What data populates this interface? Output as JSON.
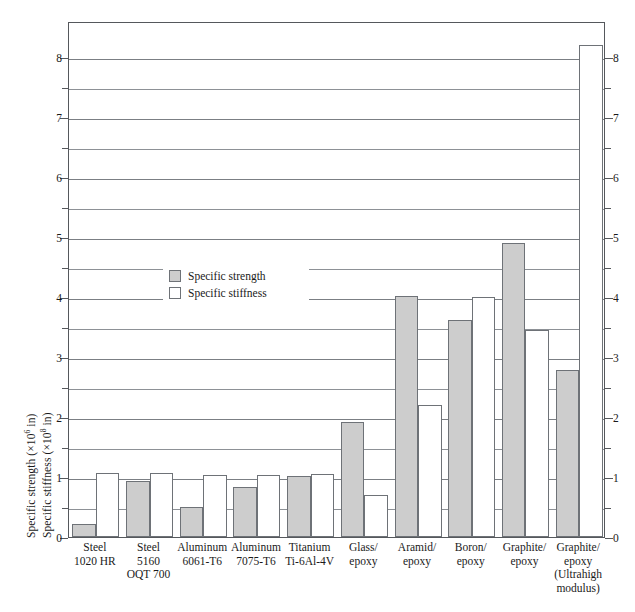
{
  "chart_data": {
    "type": "bar",
    "title": "",
    "xlabel": "",
    "ylabel_left_strength": "Specific strength (×10⁶ in)",
    "ylabel_left_stiffness": "Specific stiffness (×10⁸ in)",
    "ylabel_strength_prefix": "Specific strength (×10",
    "ylabel_strength_exp": "6",
    "ylabel_strength_suffix": " in)",
    "ylabel_stiffness_prefix": "Specific stiffness (×10",
    "ylabel_stiffness_exp": "8",
    "ylabel_stiffness_suffix": " in)",
    "ylim": [
      0,
      8.6
    ],
    "ytick_major": [
      0,
      1,
      2,
      3,
      4,
      5,
      6,
      7,
      8
    ],
    "ytick_minor": [
      0.5,
      1.5,
      2.5,
      3.5,
      4.5,
      5.5,
      6.5,
      7.5
    ],
    "ytick_labels_left": [
      "0",
      "1",
      "2",
      "3",
      "4",
      "5",
      "6",
      "7",
      "8"
    ],
    "ytick_labels_right": [
      "0",
      "1",
      "2",
      "3",
      "4",
      "5",
      "6",
      "7",
      "8"
    ],
    "grid": true,
    "legend_position": "inside-upper-left",
    "categories": [
      "Steel 1020 HR",
      "Steel 5160 OQT 700",
      "Aluminum 6061-T6",
      "Aluminum 7075-T6",
      "Titanium Ti-6Al-4V",
      "Glass/epoxy",
      "Aramid/epoxy",
      "Boron/epoxy",
      "Graphite/epoxy",
      "Graphite/epoxy (Ultrahigh modulus)"
    ],
    "category_lines": [
      [
        "Steel",
        "1020 HR"
      ],
      [
        "Steel",
        "5160",
        "OQT 700"
      ],
      [
        "Aluminum",
        "6061-T6"
      ],
      [
        "Aluminum",
        "7075-T6"
      ],
      [
        "Titanium",
        "Ti-6Al-4V"
      ],
      [
        "Glass/",
        "epoxy"
      ],
      [
        "Aramid/",
        "epoxy"
      ],
      [
        "Boron/",
        "epoxy"
      ],
      [
        "Graphite/",
        "epoxy"
      ],
      [
        "Graphite/",
        "epoxy",
        "(Ultrahigh",
        "modulus)"
      ]
    ],
    "series": [
      {
        "name": "Specific strength",
        "color": "#cdcdcd",
        "values": [
          0.22,
          0.93,
          0.5,
          0.83,
          1.02,
          1.92,
          4.02,
          3.62,
          4.9,
          2.78
        ]
      },
      {
        "name": "Specific stiffness",
        "color": "#ffffff",
        "values": [
          1.07,
          1.06,
          1.04,
          1.04,
          1.05,
          0.7,
          2.2,
          4.0,
          3.45,
          8.2
        ]
      }
    ]
  },
  "legend": {
    "items": [
      {
        "label": "Specific strength",
        "swatch": "strength"
      },
      {
        "label": "Specific stiffness",
        "swatch": "stiffness"
      }
    ]
  },
  "colors": {
    "bar_strength_fill": "#cdcdcd",
    "bar_stiffness_fill": "#ffffff",
    "bar_stroke": "#6e7277",
    "gridline": "#7b7f84",
    "frame": "#55585c",
    "text": "#1a1a1a"
  }
}
